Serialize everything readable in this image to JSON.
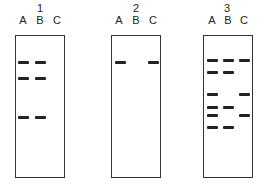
{
  "figure": {
    "gels": [
      {
        "number": "1",
        "lanes": [
          "A",
          "B",
          "C"
        ],
        "bands": [
          {
            "lane": "A",
            "y": 62
          },
          {
            "lane": "B",
            "y": 62
          },
          {
            "lane": "A",
            "y": 78
          },
          {
            "lane": "B",
            "y": 78
          },
          {
            "lane": "A",
            "y": 117
          },
          {
            "lane": "B",
            "y": 117
          }
        ]
      },
      {
        "number": "2",
        "lanes": [
          "A",
          "B",
          "C"
        ],
        "bands": [
          {
            "lane": "A",
            "y": 62
          },
          {
            "lane": "C",
            "y": 62
          }
        ]
      },
      {
        "number": "3",
        "lanes": [
          "A",
          "B",
          "C"
        ],
        "bands": [
          {
            "lane": "A",
            "y": 60
          },
          {
            "lane": "B",
            "y": 60
          },
          {
            "lane": "C",
            "y": 60
          },
          {
            "lane": "A",
            "y": 72
          },
          {
            "lane": "B",
            "y": 72
          },
          {
            "lane": "A",
            "y": 94
          },
          {
            "lane": "C",
            "y": 94
          },
          {
            "lane": "A",
            "y": 107
          },
          {
            "lane": "B",
            "y": 107
          },
          {
            "lane": "A",
            "y": 115
          },
          {
            "lane": "C",
            "y": 115
          },
          {
            "lane": "A",
            "y": 127
          },
          {
            "lane": "B",
            "y": 127
          }
        ]
      }
    ]
  }
}
